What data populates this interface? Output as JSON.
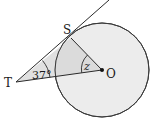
{
  "diagram": {
    "type": "geometry-tangent-circle",
    "points": {
      "T": {
        "label": "T",
        "x": 16,
        "y": 82
      },
      "S": {
        "label": "S",
        "x": 71,
        "y": 38
      },
      "O": {
        "label": "O",
        "x": 102,
        "y": 70
      }
    },
    "circle": {
      "center": "O",
      "radius": 47
    },
    "angles": {
      "T": {
        "label": "37°",
        "vertex": "T"
      },
      "O": {
        "label": "z",
        "vertex": "O"
      }
    },
    "colors": {
      "stroke": "#2a2a2a",
      "circle_fill": "#ececec",
      "triangle_fill": "#d9d9d9",
      "background": "#ffffff"
    }
  }
}
